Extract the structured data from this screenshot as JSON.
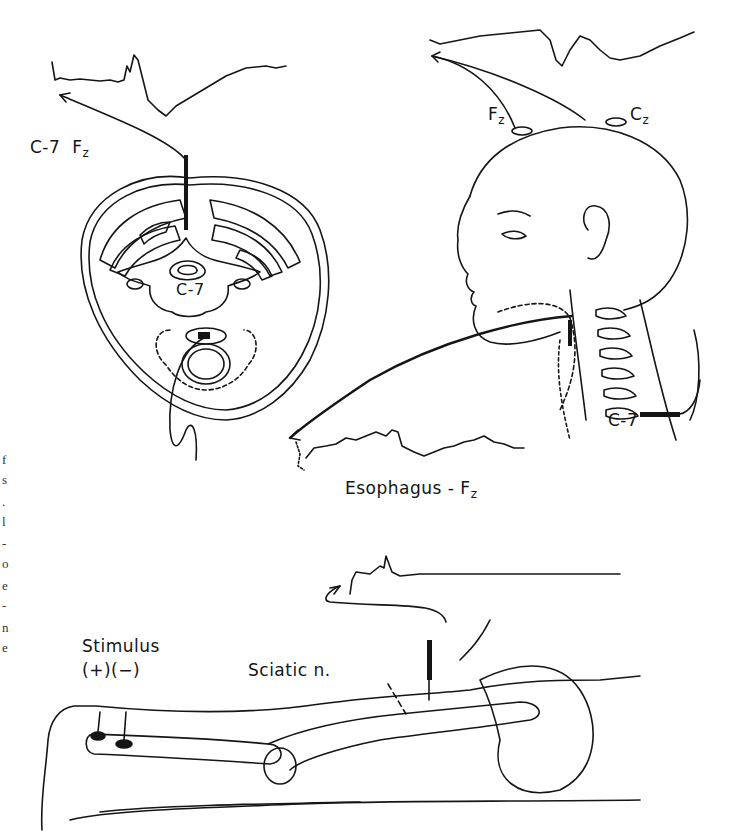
{
  "figure": {
    "panels": [
      {
        "id": "cervical-cross-section",
        "labels": {
          "recording": "C-7",
          "reference": "F",
          "reference_sub": "z",
          "vertebra": "C-7"
        },
        "waveform": "evoked-potential-trace-top-left"
      },
      {
        "id": "head-profile",
        "labels": {
          "fz": "F",
          "fz_sub": "z",
          "cz": "C",
          "cz_sub": "z",
          "c7": "C-7",
          "esophagus": "Esophagus - F",
          "esophagus_sub": "z"
        },
        "waveforms": [
          "scalp-trace-top-right",
          "esophageal-trace"
        ]
      },
      {
        "id": "leg-sciatic",
        "labels": {
          "stimulus": "Stimulus",
          "polarity": "(+)(−)",
          "nerve": "Sciatic n."
        },
        "waveform": "sciatic-trace"
      }
    ],
    "left_margin_fragments": [
      "f",
      "s",
      ".",
      "l",
      "-",
      "o",
      "e",
      "-",
      "n",
      "e"
    ]
  },
  "colors": {
    "ink": "#151515",
    "background": "#ffffff"
  }
}
